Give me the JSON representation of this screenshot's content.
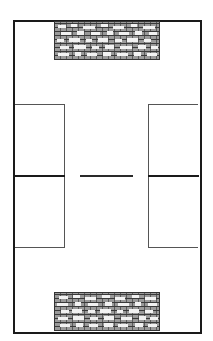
{
  "diagram": {
    "type": "floor-plan",
    "colors": {
      "background": "#ffffff",
      "line": "#1a1a1a",
      "thin_line": "#555555",
      "stone_fill": "#8a8a8a",
      "stone_mortar": "#3a3a3a",
      "stone_highlight": "#f2f2f2"
    },
    "elements": {
      "outer_boundary": {
        "x": 13,
        "y": 20,
        "width": 187,
        "height": 312
      },
      "top_stone_area": {
        "x": 54,
        "y": 21,
        "width": 106,
        "height": 39,
        "pattern": "stone-masonry"
      },
      "bottom_stone_area": {
        "x": 54,
        "y": 292,
        "width": 106,
        "height": 39,
        "pattern": "stone-masonry"
      },
      "left_box": {
        "x": 14,
        "y": 104,
        "width": 51,
        "height": 144
      },
      "right_box": {
        "x": 148,
        "y": 104,
        "width": 51,
        "height": 144
      },
      "left_divider": {
        "y": 176
      },
      "right_divider": {
        "y": 176
      },
      "center_line": {
        "x1": 80,
        "x2": 133,
        "y": 176
      }
    },
    "text_labels": []
  }
}
